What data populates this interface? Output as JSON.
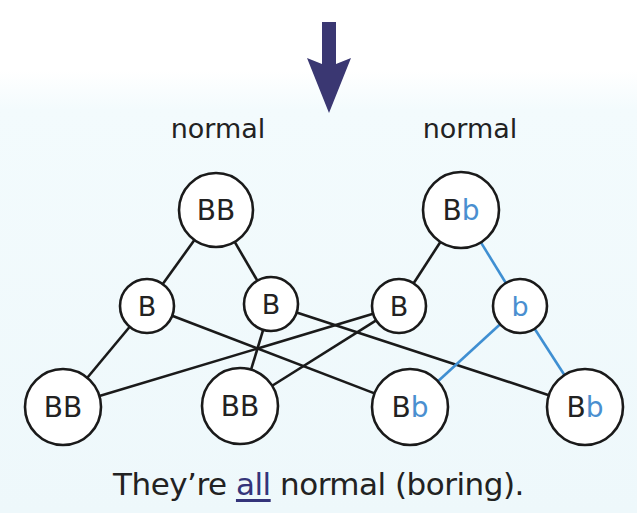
{
  "colors": {
    "arrow": "#3a3772",
    "line_dominant": "#1a1a1a",
    "line_recessive": "#3f8fd2",
    "recessive_text": "#4a8fd0",
    "text": "#222222",
    "underline_text": "#34347a"
  },
  "top_text_fragment": "",
  "arrow": {
    "icon": "down-arrow-icon"
  },
  "parents": [
    {
      "label": "normal",
      "genotype": [
        "B",
        "B"
      ],
      "recessive_flags": [
        false,
        false
      ],
      "cx": 216,
      "cy": 210,
      "r": 37,
      "label_x": 218
    },
    {
      "label": "normal",
      "genotype": [
        "B",
        "b"
      ],
      "recessive_flags": [
        false,
        true
      ],
      "cx": 461,
      "cy": 210,
      "r": 38,
      "label_x": 470
    }
  ],
  "gametes": [
    {
      "allele": "B",
      "recessive": false,
      "cx": 147,
      "cy": 306,
      "r": 27
    },
    {
      "allele": "B",
      "recessive": false,
      "cx": 271,
      "cy": 304,
      "r": 27
    },
    {
      "allele": "B",
      "recessive": false,
      "cx": 399,
      "cy": 306,
      "r": 27
    },
    {
      "allele": "b",
      "recessive": true,
      "cx": 520,
      "cy": 306,
      "r": 27
    }
  ],
  "offspring": [
    {
      "genotype": [
        "B",
        "B"
      ],
      "recessive_flags": [
        false,
        false
      ],
      "cx": 63,
      "cy": 407,
      "r": 38
    },
    {
      "genotype": [
        "B",
        "B"
      ],
      "recessive_flags": [
        false,
        false
      ],
      "cx": 240,
      "cy": 406,
      "r": 38
    },
    {
      "genotype": [
        "B",
        "b"
      ],
      "recessive_flags": [
        false,
        true
      ],
      "cx": 410,
      "cy": 407,
      "r": 38
    },
    {
      "genotype": [
        "B",
        "b"
      ],
      "recessive_flags": [
        false,
        true
      ],
      "cx": 585,
      "cy": 407,
      "r": 38
    }
  ],
  "edges": [
    {
      "from": "parent0",
      "to": "gamete0",
      "recessive": false
    },
    {
      "from": "parent0",
      "to": "gamete1",
      "recessive": false
    },
    {
      "from": "parent1",
      "to": "gamete2",
      "recessive": false
    },
    {
      "from": "parent1",
      "to": "gamete3",
      "recessive": true
    },
    {
      "from": "gamete0",
      "to": "offspring0",
      "recessive": false
    },
    {
      "from": "gamete0",
      "to": "offspring2",
      "recessive": false
    },
    {
      "from": "gamete1",
      "to": "offspring1",
      "recessive": false
    },
    {
      "from": "gamete1",
      "to": "offspring3",
      "recessive": false
    },
    {
      "from": "gamete2",
      "to": "offspring0",
      "recessive": false
    },
    {
      "from": "gamete2",
      "to": "offspring1",
      "recessive": false
    },
    {
      "from": "gamete3",
      "to": "offspring2",
      "recessive": true
    },
    {
      "from": "gamete3",
      "to": "offspring3",
      "recessive": true
    }
  ],
  "caption": {
    "prefix": "They’re ",
    "emphasis": "all",
    "suffix": " normal (boring)."
  }
}
